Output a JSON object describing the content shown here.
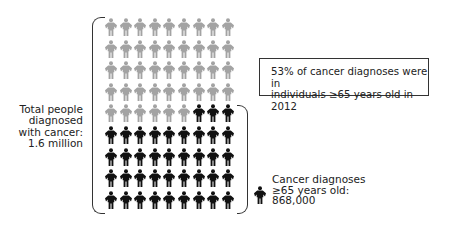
{
  "chart_data": {
    "type": "pictograph",
    "title": "53% of cancer diagnoses were in individuals ≥65 years old in 2012",
    "grid": {
      "rows": 9,
      "columns": 9,
      "total_icons": 81
    },
    "series": [
      {
        "name": "Under 65 years old",
        "icons": 42,
        "color": "#a3a3a3"
      },
      {
        "name": "Cancer diagnoses ≥65 years old",
        "icons": 39,
        "color": "#111111",
        "value": 868000
      }
    ],
    "total": {
      "label": "Total people diagnosed with cancer",
      "value": 1600000
    },
    "percent_65_plus": 53,
    "year": 2012
  },
  "labels": {
    "total_lines": [
      "Total people",
      "diagnosed",
      "with cancer:",
      "1.6 million"
    ],
    "callout_lines": [
      "53% of cancer diagnoses were in",
      "individuals ≥65 years old in 2012"
    ],
    "legend_lines": [
      "Cancer diagnoses",
      "≥65 years old:",
      "868,000"
    ]
  },
  "colors": {
    "gray_icon": "#a3a3a3",
    "black_icon": "#111111",
    "bracket": "#333333"
  }
}
